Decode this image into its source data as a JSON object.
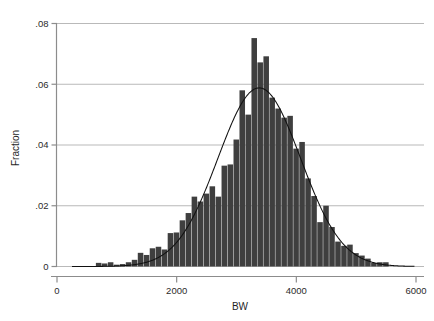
{
  "chart_data": {
    "type": "bar",
    "title": "",
    "subtitle": "",
    "xlabel": "BW",
    "ylabel": "Fraction",
    "xlim": [
      0,
      6000
    ],
    "ylim": [
      0,
      0.08
    ],
    "grid": "horizontal",
    "legend": "none",
    "x_tick_labels": [
      "0",
      "2000",
      "4000",
      "6000"
    ],
    "x_ticks": [
      0,
      2000,
      4000,
      6000
    ],
    "y_tick_labels": [
      "0",
      ".02",
      ".04",
      ".06",
      ".08"
    ],
    "y_ticks": [
      0,
      0.02,
      0.04,
      0.06,
      0.08
    ],
    "bar_color": "#3f3f3f",
    "curve_color": "#111111",
    "grid_color": "#b9b9b9",
    "axis_color": "#8c8c8c",
    "bin_width": 100,
    "categories": [
      700,
      800,
      900,
      1000,
      1100,
      1200,
      1300,
      1400,
      1500,
      1600,
      1700,
      1800,
      1900,
      2000,
      2100,
      2200,
      2300,
      2400,
      2500,
      2600,
      2700,
      2800,
      2900,
      3000,
      3100,
      3200,
      3300,
      3400,
      3500,
      3600,
      3700,
      3800,
      3900,
      4000,
      4100,
      4200,
      4300,
      4400,
      4500,
      4600,
      4700,
      4800,
      4900,
      5000,
      5100,
      5200,
      5300,
      5400,
      5500
    ],
    "values": [
      0.0012,
      0.001,
      0.0014,
      0.0006,
      0.0008,
      0.0014,
      0.0022,
      0.0045,
      0.0038,
      0.006,
      0.0065,
      0.0056,
      0.011,
      0.0112,
      0.0152,
      0.0176,
      0.023,
      0.0214,
      0.024,
      0.0264,
      0.023,
      0.0332,
      0.0336,
      0.0418,
      0.058,
      0.05,
      0.0752,
      0.0672,
      0.0692,
      0.0556,
      0.052,
      0.049,
      0.0496,
      0.0388,
      0.041,
      0.029,
      0.0232,
      0.0146,
      0.02,
      0.013,
      0.0082,
      0.0068,
      0.0072,
      0.0044,
      0.0036,
      0.0026,
      0.0012,
      0.0014,
      0.0014
    ],
    "overlay_curve": {
      "name": "normal-density",
      "type": "line",
      "mean": 3380,
      "sd": 690,
      "peak_value": 0.0588
    },
    "series": [
      {
        "name": "Fraction",
        "values": [
          0.0012,
          0.001,
          0.0014,
          0.0006,
          0.0008,
          0.0014,
          0.0022,
          0.0045,
          0.0038,
          0.006,
          0.0065,
          0.0056,
          0.011,
          0.0112,
          0.0152,
          0.0176,
          0.023,
          0.0214,
          0.024,
          0.0264,
          0.023,
          0.0332,
          0.0336,
          0.0418,
          0.058,
          0.05,
          0.0752,
          0.0672,
          0.0692,
          0.0556,
          0.052,
          0.049,
          0.0496,
          0.0388,
          0.041,
          0.029,
          0.0232,
          0.0146,
          0.02,
          0.013,
          0.0082,
          0.0068,
          0.0072,
          0.0044,
          0.0036,
          0.0026,
          0.0012,
          0.0014,
          0.0014
        ]
      }
    ]
  }
}
